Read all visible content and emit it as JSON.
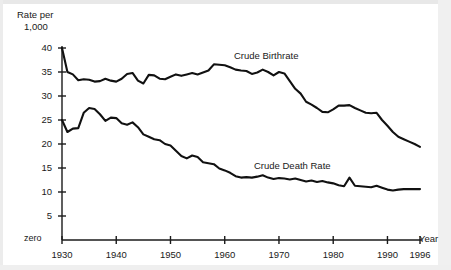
{
  "chart_data": {
    "type": "line",
    "title": "",
    "subtitle": "",
    "ylabel_line1": "Rate per",
    "ylabel_line2": "1,000",
    "xlabel": "Year",
    "zero_label": "zero",
    "xlim": [
      1930,
      1996
    ],
    "ylim": [
      0,
      40
    ],
    "grid": false,
    "legend_position": "inline-annotation",
    "x_ticks": [
      1930,
      1940,
      1950,
      1960,
      1970,
      1980,
      1990,
      1996
    ],
    "x_tick_labels": [
      "1930",
      "1940",
      "1950",
      "1960",
      "1970",
      "1980",
      "1990",
      "1996"
    ],
    "y_ticks": [
      5,
      10,
      15,
      20,
      25,
      30,
      35,
      40
    ],
    "y_tick_labels": [
      "5",
      "10",
      "15",
      "20",
      "25",
      "30",
      "35",
      "40"
    ],
    "axis_color": "#1a1a1a",
    "line_color": "#111111",
    "background_color": "#ffffff",
    "series": [
      {
        "name": "Crude Birthrate",
        "label": "Crude Birthrate",
        "x": [
          1930,
          1931,
          1932,
          1933,
          1934,
          1935,
          1936,
          1937,
          1938,
          1939,
          1940,
          1941,
          1942,
          1943,
          1944,
          1945,
          1946,
          1947,
          1948,
          1949,
          1950,
          1951,
          1952,
          1953,
          1954,
          1955,
          1956,
          1957,
          1958,
          1959,
          1960,
          1961,
          1962,
          1963,
          1964,
          1965,
          1966,
          1967,
          1968,
          1969,
          1970,
          1971,
          1972,
          1973,
          1974,
          1975,
          1976,
          1977,
          1978,
          1979,
          1980,
          1981,
          1982,
          1983,
          1984,
          1985,
          1986,
          1987,
          1988,
          1989,
          1990,
          1991,
          1992,
          1993,
          1994,
          1995,
          1996
        ],
        "values": [
          40.0,
          35.0,
          34.5,
          33.3,
          33.5,
          33.4,
          33.0,
          33.1,
          33.6,
          33.2,
          33.0,
          33.6,
          34.6,
          34.8,
          33.2,
          32.6,
          34.4,
          34.3,
          33.6,
          33.5,
          34.0,
          34.5,
          34.2,
          34.5,
          34.8,
          34.5,
          34.9,
          35.3,
          36.6,
          36.5,
          36.4,
          36.0,
          35.5,
          35.3,
          35.2,
          34.6,
          34.9,
          35.5,
          35.0,
          34.3,
          35.0,
          34.7,
          33.1,
          31.5,
          30.5,
          28.8,
          28.2,
          27.5,
          26.7,
          26.6,
          27.2,
          28.0,
          28.0,
          28.1,
          27.5,
          27.0,
          26.5,
          26.4,
          26.5,
          25.0,
          23.8,
          22.5,
          21.5,
          21.0,
          20.5,
          20.0,
          19.4
        ]
      },
      {
        "name": "Crude Death Rate",
        "label": "Crude Death Rate",
        "x": [
          1930,
          1931,
          1932,
          1933,
          1934,
          1935,
          1936,
          1937,
          1938,
          1939,
          1940,
          1941,
          1942,
          1943,
          1944,
          1945,
          1946,
          1947,
          1948,
          1949,
          1950,
          1951,
          1952,
          1953,
          1954,
          1955,
          1956,
          1957,
          1958,
          1959,
          1960,
          1961,
          1962,
          1963,
          1964,
          1965,
          1966,
          1967,
          1968,
          1969,
          1970,
          1971,
          1972,
          1973,
          1974,
          1975,
          1976,
          1977,
          1978,
          1979,
          1980,
          1981,
          1982,
          1983,
          1984,
          1985,
          1986,
          1987,
          1988,
          1989,
          1990,
          1991,
          1992,
          1993,
          1994,
          1995,
          1996
        ],
        "values": [
          25.0,
          22.5,
          23.2,
          23.3,
          26.5,
          27.5,
          27.3,
          26.2,
          24.8,
          25.5,
          25.4,
          24.3,
          24.0,
          24.5,
          23.5,
          22.0,
          21.5,
          21.0,
          20.8,
          20.0,
          19.7,
          18.6,
          17.5,
          17.0,
          17.6,
          17.3,
          16.2,
          16.0,
          15.8,
          14.9,
          14.5,
          14.0,
          13.3,
          13.0,
          13.1,
          13.0,
          13.2,
          13.5,
          13.0,
          12.7,
          12.9,
          12.8,
          12.6,
          12.8,
          12.5,
          12.2,
          12.4,
          12.1,
          12.3,
          12.0,
          11.8,
          11.4,
          11.2,
          13.0,
          11.3,
          11.2,
          11.1,
          11.0,
          11.3,
          10.9,
          10.5,
          10.3,
          10.5,
          10.6,
          10.6,
          10.6,
          10.6
        ]
      }
    ]
  }
}
